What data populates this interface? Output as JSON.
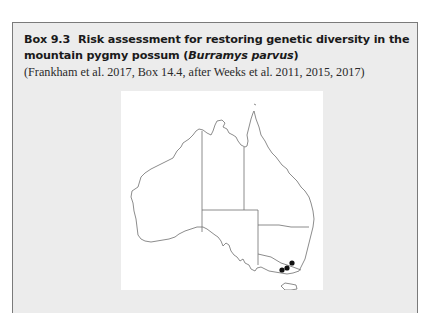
{
  "box": {
    "number": "Box 9.3",
    "title_main": "Risk assessment for restoring genetic diversity in the mountain pygmy possum (",
    "title_species": "Burramys parvus",
    "title_end": ")",
    "credit": "(Frankham et al. 2017, Box 14.4, after Weeks et al. 2011, 2015, 2017)"
  },
  "figure": {
    "marker_count": 3,
    "marker_color": "#111111",
    "outline_color": "#6e6e6e",
    "markers": [
      {
        "label": "population-1",
        "x": 161,
        "y": 179
      },
      {
        "label": "population-2",
        "x": 166,
        "y": 177
      },
      {
        "label": "population-3",
        "x": 171,
        "y": 172
      }
    ]
  }
}
